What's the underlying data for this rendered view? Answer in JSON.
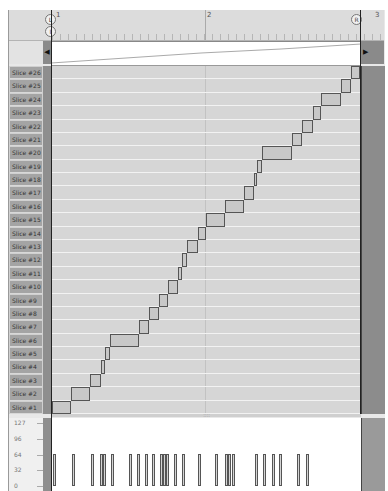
{
  "ruler": {
    "bar_numbers": [
      "1",
      "2",
      "3"
    ],
    "left_locator": "L",
    "right_locator": "R",
    "playhead_marker": "I"
  },
  "overview": {
    "scroll_left_icon": "◀",
    "scroll_right_icon": "▶"
  },
  "slices": {
    "labels": [
      "Slice #26",
      "Slice #25",
      "Slice #24",
      "Slice #23",
      "Slice #22",
      "Slice #21",
      "Slice #20",
      "Slice #19",
      "Slice #18",
      "Slice #17",
      "Slice #16",
      "Slice #15",
      "Slice #14",
      "Slice #13",
      "Slice #12",
      "Slice #11",
      "Slice #10",
      "Slice #9",
      "Slice #8",
      "Slice #7",
      "Slice #6",
      "Slice #5",
      "Slice #4",
      "Slice #3",
      "Slice #2",
      "Slice #1"
    ],
    "blocks_fraction": [
      [
        0.0,
        0.061
      ],
      [
        0.061,
        0.123
      ],
      [
        0.123,
        0.159
      ],
      [
        0.159,
        0.172
      ],
      [
        0.172,
        0.188
      ],
      [
        0.188,
        0.282
      ],
      [
        0.282,
        0.314
      ],
      [
        0.314,
        0.346
      ],
      [
        0.346,
        0.375
      ],
      [
        0.375,
        0.408
      ],
      [
        0.408,
        0.421
      ],
      [
        0.421,
        0.437
      ],
      [
        0.437,
        0.472
      ],
      [
        0.472,
        0.498
      ],
      [
        0.498,
        0.56
      ],
      [
        0.56,
        0.621
      ],
      [
        0.621,
        0.654
      ],
      [
        0.654,
        0.663
      ],
      [
        0.663,
        0.68
      ],
      [
        0.68,
        0.777
      ],
      [
        0.777,
        0.809
      ],
      [
        0.809,
        0.845
      ],
      [
        0.845,
        0.871
      ],
      [
        0.871,
        0.935
      ],
      [
        0.935,
        0.967
      ],
      [
        0.967,
        0.997
      ]
    ]
  },
  "velocity": {
    "scale_labels": [
      "127",
      "96",
      "64",
      "32",
      "0"
    ],
    "bar_positions_fraction": [
      0.0,
      0.06,
      0.122,
      0.152,
      0.162,
      0.188,
      0.245,
      0.272,
      0.298,
      0.322,
      0.347,
      0.356,
      0.365,
      0.392,
      0.418,
      0.47,
      0.525,
      0.557,
      0.566,
      0.578,
      0.655,
      0.68,
      0.708,
      0.733,
      0.79,
      0.818
    ],
    "bar_value": 64
  },
  "splitter_grip": "::::"
}
